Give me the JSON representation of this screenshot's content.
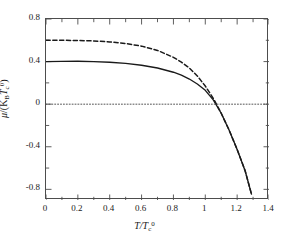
{
  "chart_data": {
    "type": "line",
    "title": "",
    "xlabel": "T/T_c^0",
    "ylabel": "mu/(K_B T_c^0)",
    "xlim": [
      0,
      1.4
    ],
    "ylim": [
      -0.9,
      0.8
    ],
    "grid": false,
    "legend": "none",
    "xticks": [
      "0",
      "0.2",
      "0.4",
      "0.6",
      "0.8",
      "1",
      "1.2",
      "1.4"
    ],
    "xtick_values": [
      0,
      0.2,
      0.4,
      0.6,
      0.8,
      1,
      1.2,
      1.4
    ],
    "yticks": [
      "0.8",
      "0.4",
      "0",
      "-0.4",
      "-0.8"
    ],
    "ytick_values": [
      0.8,
      0.4,
      0,
      -0.4,
      -0.8
    ],
    "xminor_step": 0.1,
    "yminor_step": 0.2,
    "series": [
      {
        "name": "dashed-curve",
        "style": "dashed",
        "color": "#1a1a1a",
        "x": [
          0,
          0.1,
          0.2,
          0.3,
          0.4,
          0.5,
          0.6,
          0.7,
          0.8,
          0.85,
          0.9,
          0.95,
          1.0,
          1.05,
          1.1,
          1.15,
          1.2,
          1.25,
          1.29
        ],
        "values": [
          0.6,
          0.6,
          0.598,
          0.594,
          0.585,
          0.57,
          0.545,
          0.505,
          0.44,
          0.395,
          0.34,
          0.265,
          0.17,
          0.055,
          -0.085,
          -0.245,
          -0.425,
          -0.625,
          -0.845
        ]
      },
      {
        "name": "solid-curve",
        "style": "solid",
        "color": "#1a1a1a",
        "x": [
          0,
          0.1,
          0.2,
          0.3,
          0.4,
          0.5,
          0.6,
          0.7,
          0.8,
          0.85,
          0.9,
          0.95,
          1.0,
          1.05,
          1.1,
          1.15,
          1.2,
          1.25,
          1.29
        ],
        "values": [
          0.4,
          0.402,
          0.403,
          0.4,
          0.394,
          0.383,
          0.366,
          0.34,
          0.3,
          0.272,
          0.236,
          0.19,
          0.13,
          0.04,
          -0.085,
          -0.245,
          -0.425,
          -0.625,
          -0.845
        ]
      },
      {
        "name": "zero-reference-line",
        "style": "dotted",
        "color": "#555555",
        "x": [
          0,
          1.4
        ],
        "values": [
          0,
          0
        ]
      }
    ]
  },
  "axis_titles": {
    "x_main": "T/T",
    "x_sub": "c",
    "x_sup": "0",
    "y_num": "μ",
    "y_den_open": "/(K",
    "y_den_sub1": "B",
    "y_den_mid": "T",
    "y_den_sub2": "c",
    "y_den_sup": "0",
    "y_den_close": ")"
  }
}
